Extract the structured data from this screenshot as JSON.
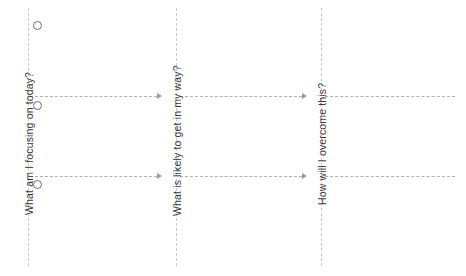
{
  "page": {
    "background_color": "#ffffff",
    "width": 466,
    "height": 276
  },
  "colors": {
    "divider_line": "#c9c9c9",
    "connector_line": "#b0b0b0",
    "arrowhead": "#9a9a9a",
    "circle_stroke": "#6d6d6d",
    "heading_text": "#3a3a3a"
  },
  "columns": [
    {
      "id": "focus",
      "heading": "What am I focusing on today?",
      "order": 1,
      "markers": [
        "",
        "",
        ""
      ]
    },
    {
      "id": "obstacles",
      "heading": "What is likely to get in my way?",
      "order": 2,
      "markers": []
    },
    {
      "id": "overcome",
      "heading": "How will I overcome this?",
      "order": 3,
      "markers": []
    }
  ],
  "dividers": [
    {
      "id": "left-rule",
      "x": 28,
      "y": 8,
      "height": 258
    },
    {
      "id": "divider-1",
      "x": 176,
      "y": 8,
      "height": 258
    },
    {
      "id": "divider-2",
      "x": 321,
      "y": 8,
      "height": 258
    }
  ],
  "connectors": [
    {
      "id": "row-1",
      "y": 96,
      "segments": [
        {
          "from_x": 30,
          "to_x": 157,
          "arrow": true
        },
        {
          "from_x": 180,
          "to_x": 302,
          "arrow": true
        },
        {
          "from_x": 325,
          "to_x": 455,
          "arrow": false
        }
      ]
    },
    {
      "id": "row-2",
      "y": 176,
      "segments": [
        {
          "from_x": 30,
          "to_x": 157,
          "arrow": true
        },
        {
          "from_x": 180,
          "to_x": 302,
          "arrow": true
        },
        {
          "from_x": 325,
          "to_x": 455,
          "arrow": false
        }
      ]
    }
  ],
  "markers": [
    {
      "id": "marker-1",
      "x": 33,
      "y": 21
    },
    {
      "id": "marker-2",
      "x": 33,
      "y": 101
    },
    {
      "id": "marker-3",
      "x": 33,
      "y": 180
    }
  ]
}
